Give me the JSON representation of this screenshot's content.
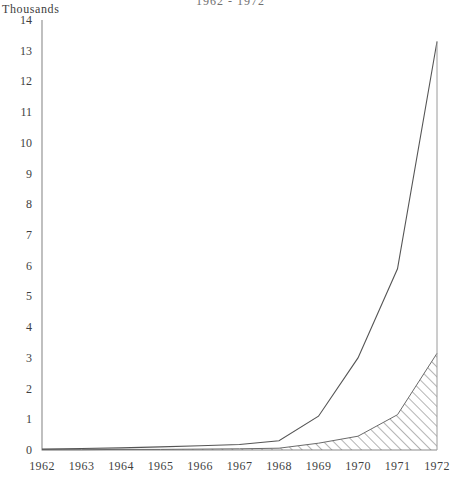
{
  "chart_data": {
    "type": "area",
    "title": "1962 - 1972",
    "title_note": "title row is cropped at the top edge of the screenshot",
    "ylabel": "Thousands",
    "xlabel": "",
    "x": [
      1962,
      1963,
      1964,
      1965,
      1966,
      1967,
      1968,
      1969,
      1970,
      1971,
      1972
    ],
    "xtick_labels": [
      "1962",
      "1963",
      "1964",
      "1965",
      "1966",
      "1967",
      "1968",
      "1969",
      "1970",
      "1971",
      "1972"
    ],
    "ytick_labels": [
      "0",
      "1",
      "2",
      "3",
      "4",
      "5",
      "6",
      "7",
      "8",
      "9",
      "10",
      "11",
      "12",
      "13",
      "14"
    ],
    "ylim": [
      0,
      14
    ],
    "xlim": [
      1962,
      1972
    ],
    "grid": false,
    "legend": "none",
    "series": [
      {
        "name": "total",
        "style": "solid-line",
        "color": "#555555",
        "values": [
          0.03,
          0.05,
          0.07,
          0.1,
          0.14,
          0.18,
          0.3,
          1.1,
          3.0,
          5.9,
          13.3
        ]
      },
      {
        "name": "hatched",
        "style": "diagonal-hatch-area",
        "color": "#6a6a6a",
        "values": [
          0.01,
          0.01,
          0.02,
          0.02,
          0.03,
          0.04,
          0.06,
          0.22,
          0.45,
          1.15,
          3.15
        ]
      }
    ]
  },
  "axes": {
    "axis_color": "#8c8c8c",
    "text_color": "#3f3f3f"
  }
}
